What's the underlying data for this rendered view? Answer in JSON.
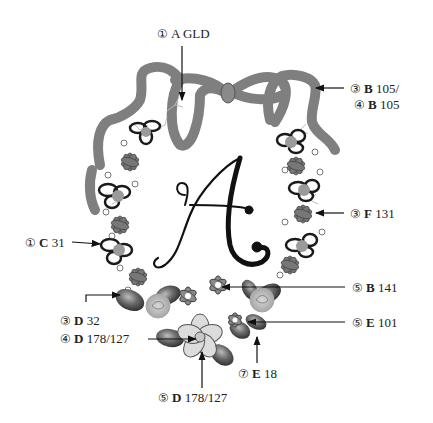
{
  "figure": {
    "monogram_letter": "A",
    "colors": {
      "ribbon": "#8f8f8f",
      "ribbon_stroke": "#5a5a5a",
      "leaf_dark": "#4a4a4a",
      "leaf_mid": "#7a7a7a",
      "petal_light": "#dcdcdc",
      "rose": "#b5b5b5",
      "flower_small": "#6f6f6f",
      "outline": "#1a1a1a"
    }
  },
  "labels": [
    {
      "id": "l1",
      "step": "①",
      "letter": "A",
      "code": "GLD"
    },
    {
      "id": "l2",
      "step": "③",
      "letter": "B",
      "code": "105/"
    },
    {
      "id": "l3",
      "step": "④",
      "letter": "B",
      "code": "105"
    },
    {
      "id": "l4",
      "step": "③",
      "letter": "F",
      "code": "131"
    },
    {
      "id": "l5",
      "step": "①",
      "letter": "C",
      "code": "31"
    },
    {
      "id": "l6",
      "step": "③",
      "letter": "D",
      "code": "32"
    },
    {
      "id": "l7",
      "step": "④",
      "letter": "D",
      "code": "178/127"
    },
    {
      "id": "l8",
      "step": "⑤",
      "letter": "B",
      "code": "141"
    },
    {
      "id": "l9",
      "step": "⑤",
      "letter": "E",
      "code": "101"
    },
    {
      "id": "l10",
      "step": "⑦",
      "letter": "E",
      "code": "18"
    },
    {
      "id": "l11",
      "step": "⑤",
      "letter": "D",
      "code": "178/127"
    }
  ]
}
